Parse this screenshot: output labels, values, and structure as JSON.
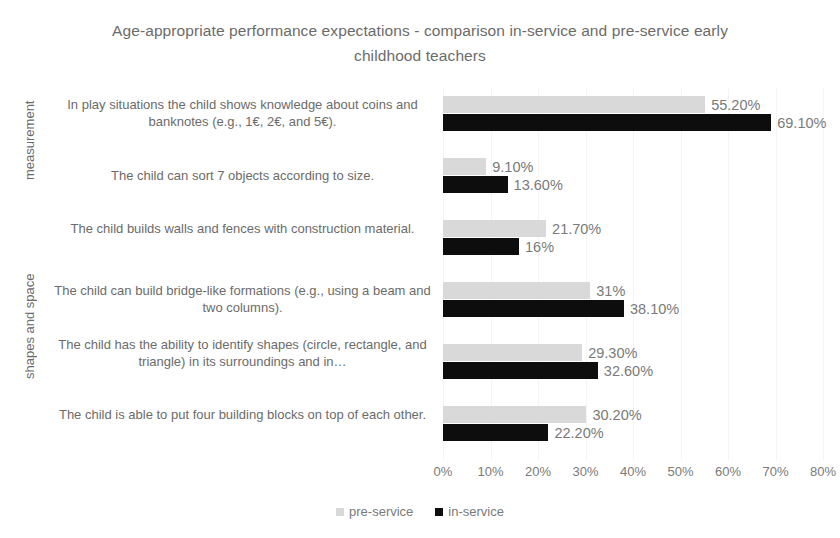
{
  "chart_data": {
    "type": "bar",
    "orientation": "horizontal",
    "title": "Age-appropriate performance expectations - comparison in-service and pre-service early childhood teachers",
    "xlabel": "",
    "ylabel": "",
    "xlim": [
      0,
      80
    ],
    "xtick_labels": [
      "0%",
      "10%",
      "20%",
      "30%",
      "40%",
      "50%",
      "60%",
      "70%",
      "80%"
    ],
    "xticks": [
      0,
      10,
      20,
      30,
      40,
      50,
      60,
      70,
      80
    ],
    "grid": true,
    "legend_position": "bottom",
    "categories": [
      "In play situations the child shows knowledge about coins and banknotes (e.g., 1€, 2€, and 5€).",
      "The child can sort 7 objects according to size.",
      "The child builds walls and fences with construction material.",
      "The child can build bridge-like formations (e.g., using a beam and two columns).",
      "The child has the ability to identify shapes (circle, rectangle, and triangle) in its surroundings and in…",
      "The child is able to put four building blocks on top of each other."
    ],
    "category_groups": [
      {
        "label": "measurement",
        "start": 0,
        "count": 2
      },
      {
        "label": "shapes and space",
        "start": 2,
        "count": 4
      }
    ],
    "series": [
      {
        "name": "pre-service",
        "color": "#d9d9d9",
        "values": [
          55.2,
          9.1,
          21.7,
          31.0,
          29.3,
          30.2
        ],
        "labels": [
          "55.20%",
          "9.10%",
          "21.70%",
          "31%",
          "29.30%",
          "30.20%"
        ]
      },
      {
        "name": "in-service",
        "color": "#0d0d0d",
        "values": [
          69.1,
          13.6,
          16.0,
          38.1,
          32.6,
          22.2
        ],
        "labels": [
          "69.10%",
          "13.60%",
          "16%",
          "38.10%",
          "32.60%",
          "22.20%"
        ]
      }
    ]
  },
  "legend": {
    "items": [
      {
        "label": "pre-service",
        "color": "#d9d9d9"
      },
      {
        "label": "in-service",
        "color": "#0d0d0d"
      }
    ]
  }
}
